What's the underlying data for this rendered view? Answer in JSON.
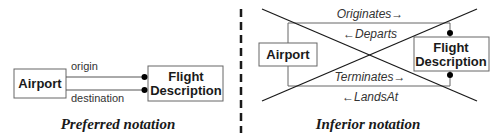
{
  "colors": {
    "box_stroke": "#666666",
    "line_stroke": "#555555",
    "cross_stroke": "#1a1a1a",
    "dot_fill": "#000000",
    "divider": "#1a1a1a",
    "background": "#ffffff"
  },
  "preferred": {
    "caption": "Preferred notation",
    "entity_a": "Airport",
    "entity_b_line1": "Flight",
    "entity_b_line2": "Description",
    "relationship_top": "origin",
    "relationship_bottom": "destination"
  },
  "inferior": {
    "caption": "Inferior notation",
    "entity_a": "Airport",
    "entity_b_line1": "Flight",
    "entity_b_line2": "Description",
    "verbs": [
      "Originates→",
      "←Departs",
      "Terminates→",
      "←LandsAt"
    ],
    "crossed_out": true
  }
}
